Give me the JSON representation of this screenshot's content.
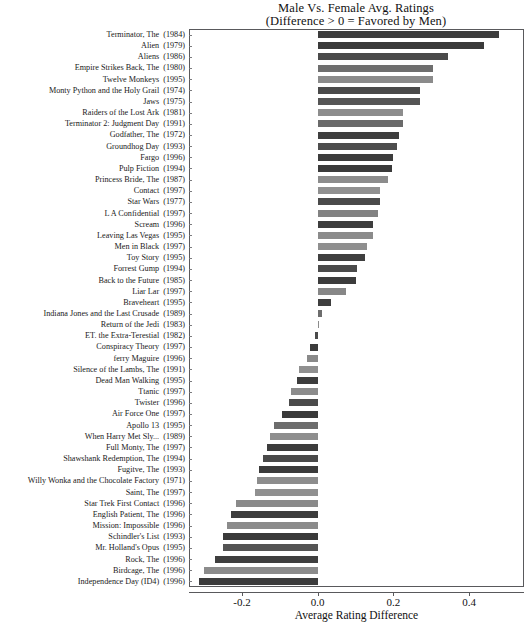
{
  "chart_data": {
    "type": "bar",
    "orientation": "horizontal",
    "title": "Male Vs. Female Avg. Ratings",
    "subtitle": "(Difference > 0 = Favored by Men)",
    "xlabel": "Average Rating Difference",
    "ylabel": "",
    "xlim": [
      -0.34,
      0.545
    ],
    "xticks": [
      -0.2,
      0.0,
      0.2,
      0.4
    ],
    "xtick_labels": [
      "-0.2",
      "0.0",
      "0.2",
      "0.4"
    ],
    "grid": false,
    "legend": null,
    "zero_reference": 0.0,
    "categories": [
      "Terminator, The  (1984)",
      "Alien  (1979)",
      "Aliens  (1986)",
      "Empire Strikes Back, The  (1980)",
      "Twelve Monkeys  (1995)",
      "Monty Python and the Holy Grail  (1974)",
      "Jaws  (1975)",
      "Raiders of the Lost Ark  (1981)",
      "Terminator 2: Judgment Day  (1991)",
      "Godfather, The  (1972)",
      "Groundhog Day  (1993)",
      "Fargo  (1996)",
      "Pulp Fiction  (1994)",
      "Princess Bride, The  (1987)",
      "Contact  (1997)",
      "Star Wars  (1977)",
      "L A Confidential  (1997)",
      "Scream  (1996)",
      "Leaving Las Vegas  (1995)",
      "Men in Black  (1997)",
      "Toy Story  (1995)",
      "Forrest Gump  (1994)",
      "Back to the Future  (1985)",
      "Liar Lar  (1997)",
      "Braveheart  (1995)",
      "Indiana Jones and the Last Crusade  (1989)",
      "Return of the Jedi  (1983)",
      "ET. the Extra-Terestial  (1982)",
      "Conspiracy Theory   (1997)",
      "ferry Maguire  (1996)",
      "Silence of the Lambs, The  (1991)",
      "Dead Man Walking  (1995)",
      "Ttanic  (1997)",
      "Twister  (1996)",
      "Air Force One  (1997)",
      "Apollo 13  (1995)",
      "When Harry Met Sly...  (1989)",
      "Full Monty, The  (1997)",
      "Shawshank Redemption, The  (1994)",
      "Fugitve, The  (1993)",
      "Willy Wonka and the Chocolate Factory  (1971)",
      "Saint, The  (1997)",
      "Star Trek First Contact  (1996)",
      "English Patient, The  (1996)",
      "Mission: Impossible  (1996)",
      "Schindler's List  (1993)",
      "Mr. Holland's Opus  (1995)",
      "Rock, The  (1996)",
      "Birdcage, The  (1996)",
      "Independence Day   (ID4)  (1996)"
    ],
    "bars": [
      {
        "title": "Terminator, The",
        "year": "(1984)",
        "value": 0.48,
        "shade": "#3c3c3c"
      },
      {
        "title": "Alien",
        "year": "(1979)",
        "value": 0.44,
        "shade": "#3a3a3a"
      },
      {
        "title": "Aliens",
        "year": "(1986)",
        "value": 0.345,
        "shade": "#4a4a4a"
      },
      {
        "title": "Empire Strikes Back, The",
        "year": "(1980)",
        "value": 0.305,
        "shade": "#6e6e6e"
      },
      {
        "title": "Twelve Monkeys",
        "year": "(1995)",
        "value": 0.305,
        "shade": "#8b8b8b"
      },
      {
        "title": "Monty Python and the Holy Grail",
        "year": "(1974)",
        "value": 0.27,
        "shade": "#4a4a4a"
      },
      {
        "title": "Jaws",
        "year": "(1975)",
        "value": 0.27,
        "shade": "#555555"
      },
      {
        "title": "Raiders of the Lost Ark",
        "year": "(1981)",
        "value": 0.225,
        "shade": "#8d8d8d"
      },
      {
        "title": "Terminator 2: Judgment Day",
        "year": "(1991)",
        "value": 0.225,
        "shade": "#6a6a6a"
      },
      {
        "title": "Godfather, The",
        "year": "(1972)",
        "value": 0.215,
        "shade": "#3e3e3e"
      },
      {
        "title": "Groundhog Day",
        "year": "(1993)",
        "value": 0.21,
        "shade": "#4d4d4d"
      },
      {
        "title": "Fargo",
        "year": "(1996)",
        "value": 0.2,
        "shade": "#3c3c3c"
      },
      {
        "title": "Pulp Fiction",
        "year": "(1994)",
        "value": 0.195,
        "shade": "#3a3a3a"
      },
      {
        "title": "Princess Bride, The",
        "year": "(1987)",
        "value": 0.185,
        "shade": "#8c8c8c"
      },
      {
        "title": "Contact",
        "year": "(1997)",
        "value": 0.165,
        "shade": "#909090"
      },
      {
        "title": "Star Wars",
        "year": "(1977)",
        "value": 0.165,
        "shade": "#4a4a4a"
      },
      {
        "title": "L A Confidential",
        "year": "(1997)",
        "value": 0.16,
        "shade": "#828282"
      },
      {
        "title": "Scream",
        "year": "(1996)",
        "value": 0.145,
        "shade": "#3d3d3d"
      },
      {
        "title": "Leaving Las Vegas",
        "year": "(1995)",
        "value": 0.145,
        "shade": "#8b8b8b"
      },
      {
        "title": "Men in Black",
        "year": "(1997)",
        "value": 0.13,
        "shade": "#8f8f8f"
      },
      {
        "title": "Toy Story",
        "year": "(1995)",
        "value": 0.125,
        "shade": "#3f3f3f"
      },
      {
        "title": "Forrest Gump",
        "year": "(1994)",
        "value": 0.105,
        "shade": "#4b4b4b"
      },
      {
        "title": "Back to the Future",
        "year": "(1985)",
        "value": 0.1,
        "shade": "#3c3c3c"
      },
      {
        "title": "Liar Lar",
        "year": "(1997)",
        "value": 0.075,
        "shade": "#878787"
      },
      {
        "title": "Braveheart",
        "year": "(1995)",
        "value": 0.035,
        "shade": "#3e3e3e"
      },
      {
        "title": "Indiana Jones and the Last Crusade",
        "year": "(1989)",
        "value": 0.012,
        "shade": "#6d6d6d"
      },
      {
        "title": "Return of the Jedi",
        "year": "(1983)",
        "value": 0.0,
        "shade": "#8c8c8c"
      },
      {
        "title": "ET. the Extra-Terestial",
        "year": "(1982)",
        "value": -0.008,
        "shade": "#4a4a4a"
      },
      {
        "title": "Conspiracy Theory",
        "year": "(1997)",
        "value": -0.02,
        "shade": "#3c3c3c"
      },
      {
        "title": "ferry Maguire",
        "year": "(1996)",
        "value": -0.028,
        "shade": "#8a8a8a"
      },
      {
        "title": "Silence of the Lambs, The",
        "year": "(1991)",
        "value": -0.05,
        "shade": "#909090"
      },
      {
        "title": "Dead Man Walking",
        "year": "(1995)",
        "value": -0.055,
        "shade": "#3d3d3d"
      },
      {
        "title": "Ttanic",
        "year": "(1997)",
        "value": -0.07,
        "shade": "#8c8c8c"
      },
      {
        "title": "Twister",
        "year": "(1996)",
        "value": -0.075,
        "shade": "#4b4b4b"
      },
      {
        "title": "Air Force One",
        "year": "(1997)",
        "value": -0.095,
        "shade": "#3a3a3a"
      },
      {
        "title": "Apollo 13",
        "year": "(1995)",
        "value": -0.115,
        "shade": "#6d6d6d"
      },
      {
        "title": "When Harry Met Sly...",
        "year": "(1989)",
        "value": -0.125,
        "shade": "#8e8e8e"
      },
      {
        "title": "Full Monty, The",
        "year": "(1997)",
        "value": -0.135,
        "shade": "#3c3c3c"
      },
      {
        "title": "Shawshank Redemption, The",
        "year": "(1994)",
        "value": -0.145,
        "shade": "#4a4a4a"
      },
      {
        "title": "Fugitve, The",
        "year": "(1993)",
        "value": -0.155,
        "shade": "#3b3b3b"
      },
      {
        "title": "Willy Wonka and the Chocolate Factory",
        "year": "(1971)",
        "value": -0.16,
        "shade": "#8d8d8d"
      },
      {
        "title": "Saint, The",
        "year": "(1997)",
        "value": -0.165,
        "shade": "#909090"
      },
      {
        "title": "Star Trek First Contact",
        "year": "(1996)",
        "value": -0.215,
        "shade": "#8a8a8a"
      },
      {
        "title": "English Patient, The",
        "year": "(1996)",
        "value": -0.23,
        "shade": "#3d3d3d"
      },
      {
        "title": "Mission: Impossible",
        "year": "(1996)",
        "value": -0.24,
        "shade": "#8b8b8b"
      },
      {
        "title": "Schindler's List",
        "year": "(1993)",
        "value": -0.25,
        "shade": "#3a3a3a"
      },
      {
        "title": "Mr. Holland's Opus",
        "year": "(1995)",
        "value": -0.25,
        "shade": "#545454"
      },
      {
        "title": "Rock, The",
        "year": "(1996)",
        "value": -0.27,
        "shade": "#3f3f3f"
      },
      {
        "title": "Birdcage, The",
        "year": "(1996)",
        "value": -0.3,
        "shade": "#8c8c8c"
      },
      {
        "title": "Independence Day   (ID4)",
        "year": "(1996)",
        "value": -0.313,
        "shade": "#3c3c3c"
      }
    ]
  },
  "axis": {
    "x_title": "Average Rating Difference",
    "x_tick_labels": [
      "-0.2",
      "0.0",
      "0.2",
      "0.4"
    ]
  },
  "title": {
    "line1": "Male Vs. Female Avg. Ratings",
    "line2": "(Difference > 0 = Favored by Men)"
  }
}
